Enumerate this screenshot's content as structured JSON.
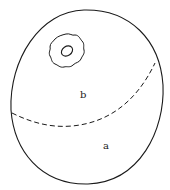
{
  "diagram": {
    "type": "line-illustration",
    "stroke_color": "#1a1a1a",
    "background": "#ffffff",
    "regions": [
      {
        "id": "b",
        "label": "b",
        "position": "upper region, above dashed line"
      },
      {
        "id": "a",
        "label": "a",
        "position": "lower region, below dashed line"
      }
    ],
    "features": [
      {
        "id": "outline",
        "description": "large closed egg-shaped outline"
      },
      {
        "id": "ring",
        "description": "wavy ring with inner oval, upper-left"
      },
      {
        "id": "divider",
        "description": "dashed curved line separating regions a and b"
      }
    ]
  },
  "labels": {
    "a": "a",
    "b": "b"
  }
}
